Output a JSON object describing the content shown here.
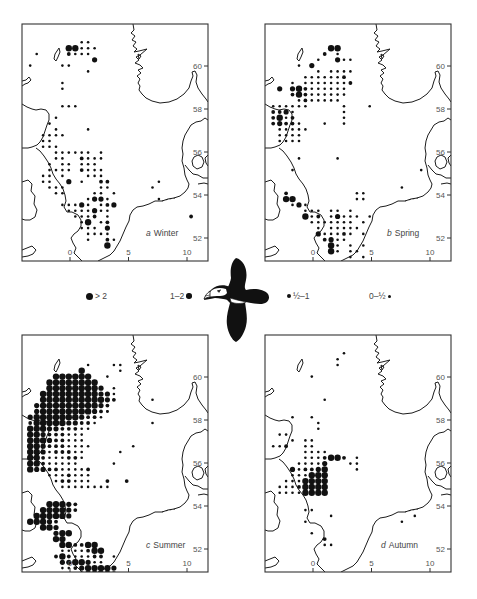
{
  "figure": {
    "longitude_ticks": [
      "0",
      "5",
      "10"
    ],
    "latitude_ticks": [
      "60",
      "58",
      "56",
      "54",
      "52"
    ]
  },
  "legend": {
    "items": [
      {
        "label": "> 2",
        "size": "large",
        "dot_side": "left"
      },
      {
        "label": "1–2",
        "size": "medium",
        "dot_side": "right"
      },
      {
        "label": "½–1",
        "size": "small",
        "dot_side": "left"
      },
      {
        "label": "0–½",
        "size": "tiny",
        "dot_side": "right"
      }
    ],
    "title": "Density classes (birds per unit area)"
  },
  "panels": [
    {
      "id": "a",
      "letter": "a",
      "season": "Winter"
    },
    {
      "id": "b",
      "letter": "b",
      "season": "Spring"
    },
    {
      "id": "c",
      "letter": "c",
      "season": "Summer"
    },
    {
      "id": "d",
      "letter": "d",
      "season": "Autumn"
    }
  ],
  "colors": {
    "ink": "#111111",
    "frame": "#333333",
    "label": "#444444",
    "background": "#ffffff"
  }
}
